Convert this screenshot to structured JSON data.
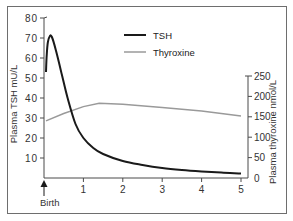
{
  "chart_data": {
    "type": "line",
    "title": "",
    "xlabel": "",
    "x_origin_label": "Birth",
    "x_ticks": [
      1,
      2,
      3,
      4,
      5
    ],
    "xlim": [
      0,
      5
    ],
    "y_left": {
      "label": "Plasma TSH mU/L",
      "ticks": [
        10,
        20,
        30,
        40,
        50,
        60,
        70,
        80
      ],
      "ylim": [
        0,
        80
      ]
    },
    "y_right": {
      "label": "Plasma thyroxine nmol/L",
      "ticks": [
        0,
        50,
        100,
        150,
        200,
        250
      ],
      "ylim": [
        0,
        250
      ]
    },
    "legend": {
      "position": "upper right",
      "entries": [
        {
          "name": "TSH",
          "color": "#1a1a1a"
        },
        {
          "name": "Thyroxine",
          "color": "#9a9a9a"
        }
      ]
    },
    "grid": false,
    "series": [
      {
        "name": "TSH",
        "axis": "left",
        "color": "#1a1a1a",
        "x": [
          0.05,
          0.07,
          0.1,
          0.15,
          0.2,
          0.3,
          0.45,
          0.6,
          0.8,
          1.0,
          1.25,
          1.5,
          2.0,
          2.5,
          3.0,
          3.5,
          4.0,
          4.5,
          5.0
        ],
        "values": [
          53,
          62,
          68,
          71,
          70.5,
          64,
          52,
          40,
          27,
          20,
          15,
          12,
          8.5,
          6.5,
          5,
          4,
          3.3,
          2.7,
          2.2
        ]
      },
      {
        "name": "Thyroxine",
        "axis": "right",
        "color": "#9a9a9a",
        "x": [
          0.05,
          0.5,
          1.0,
          1.4,
          2.0,
          3.0,
          4.0,
          5.0
        ],
        "values": [
          140,
          158,
          175,
          183,
          181,
          173,
          164,
          152
        ]
      }
    ]
  }
}
